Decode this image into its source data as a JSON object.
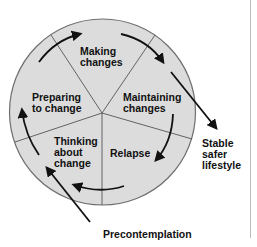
{
  "diagram": {
    "colors": {
      "circle_fill": "#dcdcdc",
      "circle_stroke": "#6e6e6e",
      "spoke_stroke": "#555555",
      "arrow": "#111111",
      "text": "#111111",
      "divider": "#bdbdbd"
    },
    "segments": [
      {
        "id": "making",
        "line1": "Making",
        "line2": "changes",
        "line3": ""
      },
      {
        "id": "maintaining",
        "line1": "Maintaining",
        "line2": "changes",
        "line3": ""
      },
      {
        "id": "relapse",
        "line1": "Relapse",
        "line2": "",
        "line3": ""
      },
      {
        "id": "thinking",
        "line1": "Thinking",
        "line2": "about",
        "line3": "change"
      },
      {
        "id": "preparing",
        "line1": "Preparing",
        "line2": "to change",
        "line3": ""
      }
    ],
    "entry": {
      "label": "Precontemplation"
    },
    "exit": {
      "line1": "Stable",
      "line2": "safer",
      "line3": "lifestyle"
    }
  }
}
